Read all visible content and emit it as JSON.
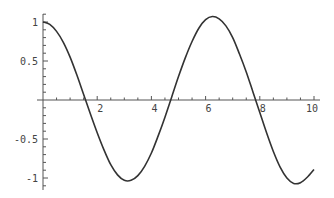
{
  "chart_data": {
    "type": "line",
    "title": "",
    "xlabel": "",
    "ylabel": "",
    "xlim": [
      0,
      10
    ],
    "ylim": [
      -1.1,
      1.1
    ],
    "grid": false,
    "legend": null,
    "x_ticks": [
      2,
      4,
      6,
      8,
      10
    ],
    "x_tick_labels": [
      "2",
      "4",
      "6",
      "8",
      "10"
    ],
    "y_ticks": [
      1,
      0.5,
      -0.5,
      -1
    ],
    "y_tick_labels": [
      "1",
      "0.5",
      "-0.5",
      "-1"
    ],
    "series": [
      {
        "name": "f(x)",
        "color": "#333333",
        "x": [
          0,
          0.25,
          0.5,
          0.75,
          1,
          1.25,
          1.5,
          1.75,
          2,
          2.25,
          2.5,
          2.75,
          3,
          3.25,
          3.5,
          3.75,
          4,
          4.25,
          4.5,
          4.75,
          5,
          5.25,
          5.5,
          5.75,
          6,
          6.25,
          6.5,
          6.75,
          7,
          7.25,
          7.5,
          7.75,
          8,
          8.25,
          8.5,
          8.75,
          9,
          9.25,
          9.5,
          9.75,
          10
        ],
        "y": [
          1.0,
          0.97,
          0.88,
          0.74,
          0.55,
          0.32,
          0.07,
          -0.18,
          -0.42,
          -0.64,
          -0.83,
          -0.96,
          -1.03,
          -1.03,
          -0.97,
          -0.85,
          -0.68,
          -0.46,
          -0.22,
          0.04,
          0.3,
          0.54,
          0.75,
          0.92,
          1.03,
          1.07,
          1.04,
          0.95,
          0.8,
          0.59,
          0.36,
          0.1,
          -0.16,
          -0.42,
          -0.66,
          -0.86,
          -1.0,
          -1.07,
          -1.06,
          -0.99,
          -0.89
        ]
      }
    ]
  }
}
